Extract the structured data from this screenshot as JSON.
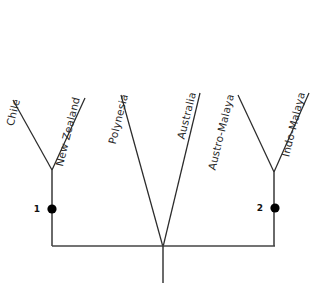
{
  "figure": {
    "type": "cladogram",
    "background_color": "#ffffff",
    "line_color": "#2b2b2b",
    "node_color": "#000000",
    "label_color": "#2a2a2a",
    "label_rotation_deg": -76
  },
  "taxa": [
    {
      "label": "Chile",
      "tip_x": 13,
      "tip_y": 100,
      "label_x": 20,
      "label_y": 100
    },
    {
      "label": "New Zealand",
      "tip_x": 85,
      "tip_y": 98,
      "label_x": 80,
      "label_y": 98
    },
    {
      "label": "Polynesia",
      "tip_x": 121,
      "tip_y": 95,
      "label_x": 128,
      "label_y": 95
    },
    {
      "label": "Australia",
      "tip_x": 200,
      "tip_y": 93,
      "label_x": 196,
      "label_y": 93
    },
    {
      "label": "Austro-Malaya",
      "tip_x": 238,
      "tip_y": 95,
      "label_x": 234,
      "label_y": 95
    },
    {
      "label": "Indo-Malaya",
      "tip_x": 309,
      "tip_y": 93,
      "label_x": 305,
      "label_y": 93
    }
  ],
  "nodes": [
    {
      "number": "1",
      "dot_x": 52,
      "dot_y": 209,
      "label_x": 40,
      "label_y": 212
    },
    {
      "number": "2",
      "dot_x": 275,
      "dot_y": 208,
      "label_x": 263,
      "label_y": 211
    }
  ],
  "geometry": {
    "left_clade_apex": {
      "x": 52,
      "y": 170
    },
    "right_clade_apex": {
      "x": 274,
      "y": 172
    },
    "root_junction": {
      "x": 163,
      "y": 247
    },
    "baseline_y": 246,
    "baseline_x_start": 52,
    "baseline_x_end": 275,
    "root_stem_bottom_y": 283
  },
  "branches": {
    "chile": "M13,100 L52,170",
    "new_zealand": "M85,98 L52,170",
    "polynesia": "M121,95 L163,247",
    "australia": "M200,93 L163,247",
    "austro_malaya": "M238,95 L274,172",
    "indo_malaya": "M309,93 L274,172",
    "left_spine": "M52,170 L52,246",
    "right_spine": "M274,172 L274,246",
    "baseline": "M52,246 L275,246",
    "root_stem": "M163,247 L163,283"
  }
}
